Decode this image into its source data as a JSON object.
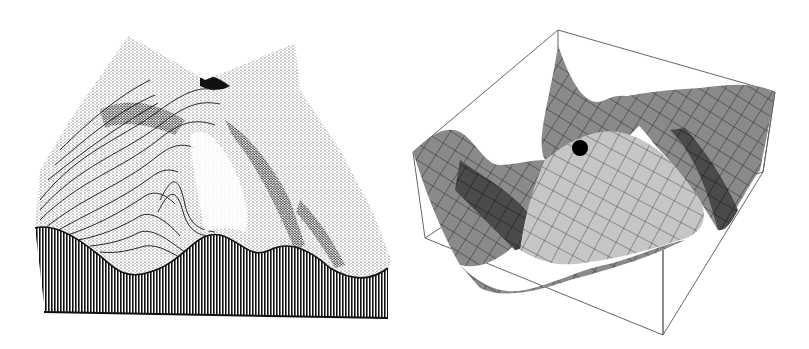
{
  "figures": [
    {
      "id": "left",
      "kind": "stippled-landscape-surface",
      "description": "Engraved / stippled 3D terrain with a saddle at the top and wavy cross-section front face",
      "colors": {
        "ink": "#111111",
        "paper": "#ffffff"
      }
    },
    {
      "id": "right",
      "kind": "mesh-saddle-surface-in-box",
      "description": "Shaded wire-mesh wavy surface inside a wireframe bounding box with a ball resting on it",
      "colors": {
        "box_line": "#555555",
        "light_face": "#c8c8c8",
        "mid_face": "#8a8a8a",
        "dark_face": "#3a3a3a",
        "ball": "#000000"
      },
      "ball": {
        "x": 180,
        "y": 148,
        "r": 8
      }
    }
  ]
}
